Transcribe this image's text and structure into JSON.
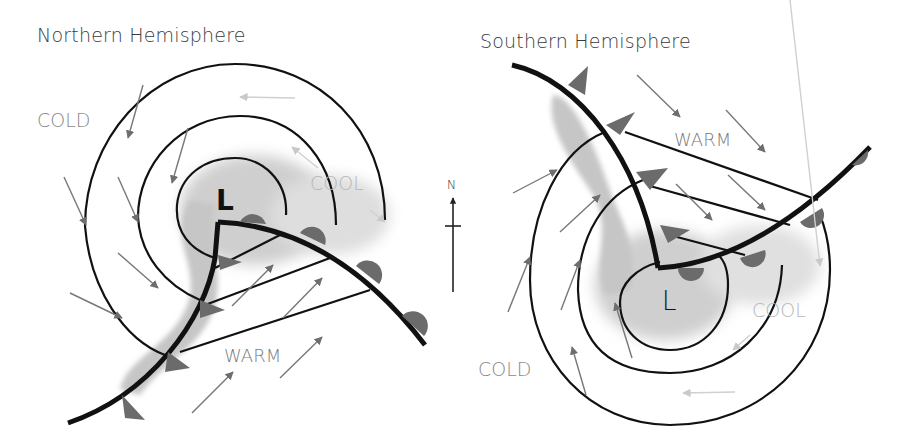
{
  "diagram": {
    "type": "mid-latitude cyclone comparison",
    "colors": {
      "isobar": "#111111",
      "front": "#111111",
      "front_symbol": "#6b6b6b",
      "wind_arrow": "#707070",
      "light_arrow": "#c9c9c9",
      "precip_shade": "#c8c8c8",
      "label_gray": "#8a8a8a",
      "cool_label": "#b5b5b5",
      "title_text": "#3a3a3a"
    },
    "panels": [
      {
        "id": "northern",
        "title": "Northern Hemisphere",
        "low_label": "L",
        "air_mass_labels": {
          "cold": "COLD",
          "cool": "COOL",
          "warm": "WARM"
        },
        "circulation": "counterclockwise"
      },
      {
        "id": "southern",
        "title": "Southern Hemisphere",
        "low_label": "L",
        "air_mass_labels": {
          "cold": "COLD",
          "cool": "COOL",
          "warm": "WARM"
        },
        "circulation": "clockwise"
      }
    ],
    "compass": {
      "label": "N"
    }
  }
}
